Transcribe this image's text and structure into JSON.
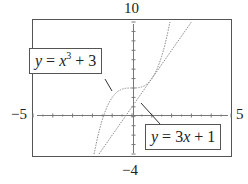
{
  "chart_data": {
    "type": "line",
    "title": "",
    "xlabel": "",
    "ylabel": "",
    "xlim": [
      -5,
      5
    ],
    "ylim": [
      -4,
      10
    ],
    "grid": false,
    "axis_labels": {
      "top": "10",
      "bottom": "−4",
      "left": "−5",
      "right": "5"
    },
    "series": [
      {
        "name": "y = x^3 + 3",
        "expression": "x^3 + 3",
        "style": "dotted",
        "x": [
          -1.91,
          -1.5,
          -1,
          -0.5,
          0,
          0.5,
          1,
          1.5,
          1.91
        ],
        "y": [
          -4,
          -0.375,
          2,
          2.875,
          3,
          3.125,
          4,
          6.375,
          10
        ]
      },
      {
        "name": "y = 3x + 1",
        "expression": "3x + 1",
        "style": "dotted",
        "x": [
          -1.67,
          0,
          3
        ],
        "y": [
          -4,
          1,
          10
        ]
      }
    ],
    "annotations": [
      {
        "text": "y = x^3 + 3",
        "points_to": "cubic curve near (-1, 2)"
      },
      {
        "text": "y = 3x + 1",
        "points_to": "line near (0.5, 2.5)"
      }
    ]
  },
  "labels": {
    "top": "10",
    "bottom": "−4",
    "left": "−5",
    "right": "5"
  },
  "callouts": {
    "cubic": {
      "y": "y",
      "eq": "=",
      "x": "x",
      "exp": "3",
      "plus": "+",
      "c": "3"
    },
    "linear": {
      "y": "y",
      "eq": "=",
      "coef": "3",
      "x": "x",
      "plus": "+",
      "c": "1"
    }
  },
  "colors": {
    "frame": "#555555",
    "curve": "#777777",
    "axis": "#666666"
  }
}
